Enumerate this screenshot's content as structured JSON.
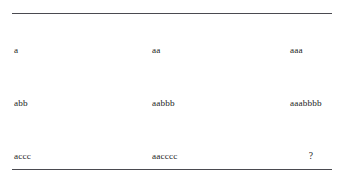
{
  "document": {
    "kind": "table",
    "background_color": "#ffffff",
    "text_color": "#1b1b1b",
    "rule_color": "#4a4a50"
  },
  "table": {
    "rows": [
      {
        "cells": [
          "a",
          "aa",
          "aaa"
        ]
      },
      {
        "cells": [
          "abb",
          "aabbb",
          "aaabbbb"
        ]
      },
      {
        "cells": [
          "accc",
          "aacccc",
          "?"
        ]
      }
    ]
  }
}
